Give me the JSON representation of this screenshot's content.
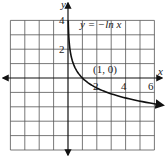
{
  "chart_data": {
    "type": "line",
    "title": "",
    "function_label": "y = −ln x",
    "xlabel": "x",
    "ylabel": "y",
    "xlim": [
      -4,
      6
    ],
    "ylim": [
      -5,
      4
    ],
    "grid": true,
    "x_tick_labels": [
      "2",
      "4",
      "6"
    ],
    "x_ticks": [
      2,
      4,
      6
    ],
    "y_tick_labels": [
      "2",
      "4"
    ],
    "y_ticks": [
      2,
      4
    ],
    "annotation": {
      "text": "(1, 0)",
      "x": 1,
      "y": 0
    },
    "series": [
      {
        "name": "y = −ln x",
        "x": [
          0.02,
          0.05,
          0.1,
          0.2,
          0.3,
          0.5,
          0.75,
          1,
          1.5,
          2,
          3,
          4,
          5,
          6.5
        ],
        "y": [
          3.91,
          3.0,
          2.3,
          1.61,
          1.2,
          0.69,
          0.29,
          0,
          -0.41,
          -0.69,
          -1.1,
          -1.39,
          -1.61,
          -1.87
        ]
      }
    ]
  },
  "labels": {
    "x_axis": "x",
    "y_axis": "y",
    "function": "y = −ln x",
    "point": "(1, 0)",
    "tick_x_2": "2",
    "tick_x_4": "4",
    "tick_x_6": "6",
    "tick_y_2": "2",
    "tick_y_4": "4"
  }
}
